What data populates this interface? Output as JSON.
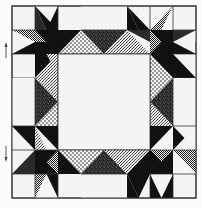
{
  "figure": {
    "grid": {
      "cols": 8,
      "rows": 8,
      "x0": 12,
      "y0": 6,
      "cell_w": 23,
      "cell_h": 24
    },
    "colors": {
      "background": "#f2f2f2",
      "black": "#111111",
      "dark": "#2a2a2a",
      "line": "#333333",
      "white": "#f4f4f4"
    },
    "fabrics": [
      "black",
      "dark-print",
      "checkered",
      "dotted-light",
      "speckled"
    ],
    "markers": [
      {
        "name": "up-arrow",
        "direction": "up",
        "y": 50
      },
      {
        "name": "down-arrow",
        "direction": "down",
        "y": 152
      }
    ]
  }
}
